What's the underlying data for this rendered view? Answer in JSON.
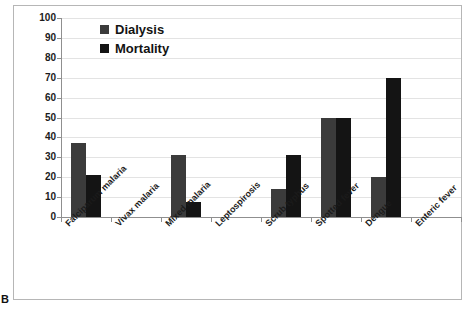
{
  "panel": {
    "letter": "B"
  },
  "chart_data": {
    "type": "bar",
    "title": "",
    "subtitle": "",
    "xlabel": "",
    "ylabel": "",
    "ylim": [
      0,
      100
    ],
    "y_ticks": [
      0,
      10,
      20,
      30,
      40,
      50,
      60,
      70,
      80,
      90,
      100
    ],
    "grid": true,
    "legend_position": "top-left",
    "categories": [
      "Falciparum malaria",
      "Vivax malaria",
      "Mixed malaria",
      "Leptospirosis",
      "Scrub typhus",
      "Spotted fever",
      "Dengue",
      "Enteric fever"
    ],
    "series": [
      {
        "name": "Dialysis",
        "color": "#3b3b3b",
        "values": [
          37,
          0,
          31,
          0,
          14,
          50,
          20,
          0
        ]
      },
      {
        "name": "Mortality",
        "color": "#141414",
        "values": [
          21,
          0,
          7.5,
          0,
          31,
          50,
          70,
          0
        ]
      }
    ]
  },
  "legend": {
    "items": [
      {
        "label": "Dialysis",
        "swatch": "dialysis-swatch-icon"
      },
      {
        "label": "Mortality",
        "swatch": "mortality-swatch-icon"
      }
    ]
  },
  "axis": {
    "y_tick_labels": [
      "100",
      "90",
      "80",
      "70",
      "60",
      "50",
      "40",
      "30",
      "20",
      "10",
      "0"
    ]
  }
}
